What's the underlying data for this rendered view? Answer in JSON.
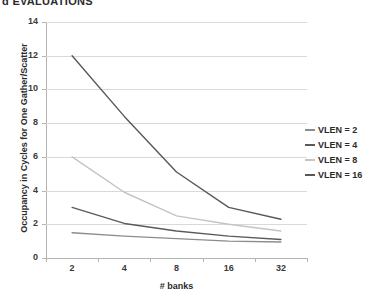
{
  "top_text": "d EVALUATIONS",
  "chart_data": {
    "type": "line",
    "title": "",
    "xlabel": "# banks",
    "ylabel": "Occupancy in Cycles for One Gather/Scatter",
    "categories": [
      "2",
      "4",
      "8",
      "16",
      "32"
    ],
    "ylim": [
      0,
      14
    ],
    "yticks": [
      "0",
      "2",
      "4",
      "6",
      "8",
      "10",
      "12",
      "14"
    ],
    "grid": true,
    "legend_position": "right",
    "series": [
      {
        "name": "VLEN = 2",
        "values": [
          1.5,
          1.3,
          1.15,
          1.0,
          0.95
        ],
        "color": "#8c8c8c"
      },
      {
        "name": "VLEN = 4",
        "values": [
          3.0,
          2.05,
          1.6,
          1.3,
          1.1
        ],
        "color": "#5a5a5a"
      },
      {
        "name": "VLEN = 8",
        "values": [
          6.0,
          3.9,
          2.5,
          2.0,
          1.6
        ],
        "color": "#c4c4c4"
      },
      {
        "name": "VLEN = 16",
        "values": [
          12.0,
          8.4,
          5.1,
          3.0,
          2.3
        ],
        "color": "#585858"
      }
    ]
  }
}
